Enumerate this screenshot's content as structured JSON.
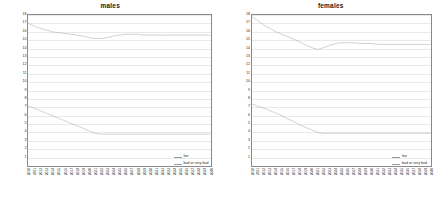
{
  "figure": {
    "panels": [
      "males",
      "females"
    ]
  },
  "chart_data": [
    {
      "type": "line",
      "title": "males",
      "xlabel": "",
      "ylabel": "Proportion of population of given rate of health (%)",
      "ylim": [
        0,
        18
      ],
      "yticks": [
        18,
        17,
        16,
        15,
        14,
        13,
        12,
        11,
        10,
        9,
        8,
        7,
        6,
        5,
        4,
        3,
        2,
        1
      ],
      "grid": true,
      "legend_position": "bottom-right",
      "x": [
        "2010",
        "2011",
        "2012",
        "2013",
        "2014",
        "2015",
        "2016",
        "2017",
        "2018",
        "2019",
        "2020",
        "2021",
        "2022",
        "2023",
        "2024",
        "2025",
        "2026",
        "2027",
        "2028",
        "2029",
        "2030",
        "2031",
        "2032",
        "2033",
        "2034",
        "2035",
        "2036",
        "2037",
        "2038",
        "2039",
        "2040"
      ],
      "series": [
        {
          "name": "fair",
          "color": "#9a9a9a",
          "values": [
            17.0,
            16.7,
            16.4,
            16.2,
            16.0,
            15.9,
            15.8,
            15.7,
            15.6,
            15.5,
            15.3,
            15.2,
            15.2,
            15.3,
            15.5,
            15.6,
            15.7,
            15.7,
            15.7,
            15.6,
            15.6,
            15.6,
            15.6,
            15.6,
            15.6,
            15.6,
            15.6,
            15.6,
            15.6,
            15.6,
            15.6
          ]
        },
        {
          "name": "bad or very bad",
          "color": "#9a9a9a",
          "values": [
            7.2,
            6.9,
            6.6,
            6.3,
            6.0,
            5.7,
            5.4,
            5.1,
            4.8,
            4.5,
            4.2,
            3.9,
            3.8,
            3.8,
            3.8,
            3.8,
            3.8,
            3.8,
            3.8,
            3.8,
            3.8,
            3.8,
            3.8,
            3.8,
            3.8,
            3.8,
            3.8,
            3.8,
            3.8,
            3.8,
            3.8
          ]
        }
      ]
    },
    {
      "type": "line",
      "title": "females",
      "xlabel": "",
      "ylabel": "Proportion of population of given rate of health (%)",
      "ylim": [
        0,
        18
      ],
      "yticks": [
        18,
        17,
        16,
        15,
        14,
        13,
        12,
        11,
        10,
        9,
        8,
        7,
        6,
        5,
        4,
        3,
        2,
        1
      ],
      "grid": true,
      "legend_position": "bottom-right",
      "x": [
        "2010",
        "2011",
        "2012",
        "2013",
        "2014",
        "2015",
        "2016",
        "2017",
        "2018",
        "2019",
        "2020",
        "2021",
        "2022",
        "2023",
        "2024",
        "2025",
        "2026",
        "2027",
        "2028",
        "2029",
        "2030",
        "2031",
        "2032",
        "2033",
        "2034",
        "2035",
        "2036",
        "2037",
        "2038",
        "2039",
        "2040"
      ],
      "series": [
        {
          "name": "fair",
          "color": "#9a9a9a",
          "values": [
            17.8,
            17.3,
            16.8,
            16.4,
            16.0,
            15.7,
            15.4,
            15.1,
            14.8,
            14.4,
            14.1,
            13.9,
            14.1,
            14.4,
            14.6,
            14.7,
            14.7,
            14.7,
            14.6,
            14.6,
            14.6,
            14.5,
            14.5,
            14.5,
            14.5,
            14.5,
            14.5,
            14.5,
            14.5,
            14.5,
            14.5
          ]
        },
        {
          "name": "bad or very bad",
          "color": "#9a9a9a",
          "values": [
            7.4,
            7.1,
            6.9,
            6.6,
            6.3,
            6.0,
            5.6,
            5.3,
            4.9,
            4.6,
            4.3,
            4.0,
            3.9,
            3.9,
            3.9,
            3.9,
            3.9,
            3.9,
            3.9,
            3.9,
            3.9,
            3.9,
            3.9,
            3.9,
            3.9,
            3.9,
            3.9,
            3.9,
            3.9,
            3.9,
            3.9
          ]
        }
      ]
    }
  ]
}
